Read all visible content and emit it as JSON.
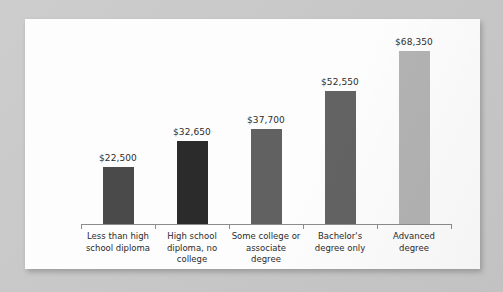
{
  "chart_data": {
    "type": "bar",
    "title": "",
    "subtitle": "",
    "xlabel": "",
    "ylabel": "",
    "ylim": [
      0,
      68350
    ],
    "grid": false,
    "legend": false,
    "categories": [
      "Less than high school diploma",
      "High school diploma, no college",
      "Some college or associate degree",
      "Bachelor's degree only",
      "Advanced degree"
    ],
    "category_lines": [
      [
        "Less than high",
        "school diploma"
      ],
      [
        "High school",
        "diploma, no",
        "college"
      ],
      [
        "Some college or",
        "associate",
        "degree"
      ],
      [
        "Bachelor's",
        "degree only"
      ],
      [
        "Advanced",
        "degree"
      ]
    ],
    "values": [
      22500,
      32650,
      37700,
      52550,
      68350
    ],
    "value_labels": [
      "$22,500",
      "$32,650",
      "$37,700",
      "$52,550",
      "$68,350"
    ],
    "bar_colors": [
      "#4a4a4a",
      "#2b2b2b",
      "#616161",
      "#636363",
      "#b3b3b3"
    ],
    "axis_color": "#8c8c8c",
    "text_color": "#2b2b2b",
    "card_color": "#fdfdfd",
    "background_color": "#c9c9c9"
  }
}
